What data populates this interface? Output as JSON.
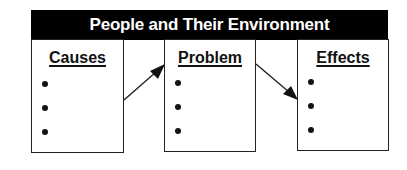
{
  "title": "People and Their Environment",
  "columns": [
    {
      "heading": "Causes",
      "bullets": [
        "",
        "",
        ""
      ]
    },
    {
      "heading": "Problem",
      "bullets": [
        "",
        "",
        ""
      ]
    },
    {
      "heading": "Effects",
      "bullets": [
        "",
        "",
        ""
      ]
    }
  ],
  "arrows": [
    {
      "from": "Causes",
      "to": "Problem"
    },
    {
      "from": "Problem",
      "to": "Effects"
    }
  ],
  "colors": {
    "header_bg": "#000000",
    "header_text": "#ffffff",
    "line": "#222222"
  }
}
